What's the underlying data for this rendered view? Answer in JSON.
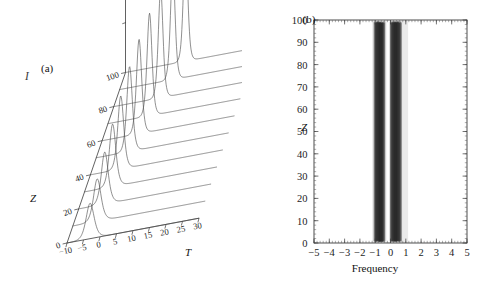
{
  "figure": {
    "background": "#ffffff",
    "ink": "#3a3a3a"
  },
  "panel_a": {
    "label": "(a)",
    "xlabel": "T",
    "zlabel": "Z",
    "ylabel": "I",
    "x_ticks": [
      "-10",
      "-5",
      "0",
      "5",
      "10",
      "15",
      "20",
      "25",
      "30"
    ],
    "z_ticks": [
      "0",
      "20",
      "40",
      "60",
      "80",
      "100"
    ]
  },
  "panel_b": {
    "label": "(b)",
    "xlabel": "Frequency",
    "ylabel": "Z",
    "x_ticks": [
      "-5",
      "-4",
      "-3",
      "-2",
      "-1",
      "0",
      "1",
      "2",
      "3",
      "4",
      "5"
    ],
    "y_ticks": [
      "0",
      "10",
      "20",
      "30",
      "40",
      "50",
      "60",
      "70",
      "80",
      "90",
      "100"
    ]
  },
  "chart_data": [
    {
      "type": "line",
      "panel": "a",
      "title": "(a)",
      "xlabel": "T",
      "ylabel": "I",
      "zlabel": "Z",
      "xlim": [
        -10,
        30
      ],
      "zlim": [
        0,
        100
      ],
      "grid": false,
      "legend": false,
      "description": "3D waterfall of pulse intensity profiles I(T) at successive propagation distances Z; the single soliton-like peak grows in amplitude, narrows and drifts toward larger T as Z increases.",
      "z_values": [
        0,
        10,
        20,
        30,
        40,
        50,
        60,
        70,
        80,
        90,
        100
      ],
      "traces": [
        {
          "z": 0,
          "peak_T": -3.0,
          "peak_I": 0.3,
          "width": 1.45
        },
        {
          "z": 10,
          "peak_T": -2.6,
          "peak_I": 0.36,
          "width": 1.36
        },
        {
          "z": 20,
          "peak_T": -2.1,
          "peak_I": 0.44,
          "width": 1.26
        },
        {
          "z": 30,
          "peak_T": -1.5,
          "peak_I": 0.53,
          "width": 1.17
        },
        {
          "z": 40,
          "peak_T": -0.8,
          "peak_I": 0.62,
          "width": 1.08
        },
        {
          "z": 50,
          "peak_T": 0.1,
          "peak_I": 0.72,
          "width": 1.0
        },
        {
          "z": 60,
          "peak_T": 1.2,
          "peak_I": 0.8,
          "width": 0.94
        },
        {
          "z": 70,
          "peak_T": 2.6,
          "peak_I": 0.87,
          "width": 0.89
        },
        {
          "z": 80,
          "peak_T": 4.2,
          "peak_I": 0.92,
          "width": 0.85
        },
        {
          "z": 90,
          "peak_T": 6.1,
          "peak_I": 0.96,
          "width": 0.82
        },
        {
          "z": 100,
          "peak_T": 8.2,
          "peak_I": 1.0,
          "width": 0.8
        }
      ]
    },
    {
      "type": "heatmap",
      "panel": "b",
      "title": "(b)",
      "xlabel": "Frequency",
      "ylabel": "Z",
      "xlim": [
        -5,
        5
      ],
      "ylim": [
        0,
        100
      ],
      "grid": false,
      "legend": false,
      "description": "Spectral evolution map: intensity of the pulse spectrum versus frequency as a function of propagation distance Z. Two dense dark vertical bands (spectral sidebands) appear near frequency -0.75 and +0.35, separated by a narrow bright gap near -0.15, with fine vertical striations. The bands are present over the full Z range 0 to 100.",
      "bands": [
        {
          "name": "left-band",
          "center": -0.72,
          "half_width": 0.4,
          "peak_darkness": 0.82
        },
        {
          "name": "right-band",
          "center": 0.34,
          "half_width": 0.42,
          "peak_darkness": 0.86
        }
      ],
      "gap": {
        "center": -0.16,
        "half_width": 0.1
      },
      "outer_halo": {
        "from": -1.2,
        "to": 1.15,
        "darkness": 0.18
      }
    }
  ]
}
